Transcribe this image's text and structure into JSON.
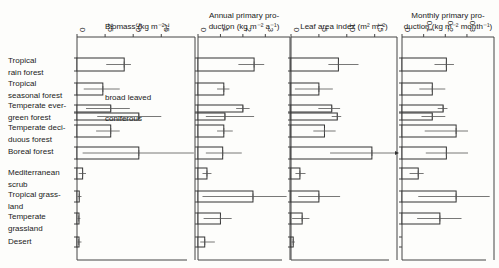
{
  "chart_data": {
    "type": "bar",
    "orientation": "horizontal",
    "categories": [
      "Tropical rain forest",
      "Tropical seasonal forest",
      "Temperate evergreen forest (broad leaved)",
      "Temperate evergreen forest (coniferous)",
      "Temperate deciduous forest",
      "Boreal forest",
      "Mediterranean scrub",
      "Tropical grassland",
      "Temperate grassland",
      "Desert"
    ],
    "row_labels": [
      [
        "Tropical",
        "rain forest"
      ],
      [
        "Tropical",
        "seasonal forest"
      ],
      [
        "Temperate ever-",
        "green forest"
      ],
      [
        "Temperate deci-",
        "duous forest"
      ],
      [
        "Boreal forest"
      ],
      [
        "Mediterranean",
        "scrub"
      ],
      [
        "Tropical grass-",
        "land"
      ],
      [
        "Temperate",
        "grassland"
      ],
      [
        "Desert"
      ]
    ],
    "annotations": [
      "broad leaved",
      "coniferous"
    ],
    "panels": [
      {
        "title": [
          "Biomass (kg m⁻²)"
        ],
        "ticks": [
          0,
          25,
          50,
          75
        ],
        "xlim": [
          0,
          105
        ],
        "values": [
          42,
          23,
          30,
          55,
          30,
          55,
          5,
          2,
          1.5,
          1.5
        ],
        "err_low": [
          26,
          6,
          8,
          18,
          17,
          5,
          1.5,
          0.5,
          0.5,
          0.5
        ],
        "err_high": [
          48,
          38,
          47,
          75,
          38,
          104,
          8,
          4,
          3,
          4
        ]
      },
      {
        "title": [
          "Annual primary pro-",
          "duction (kg m⁻² a⁻¹)"
        ],
        "ticks": [
          0,
          1,
          2,
          3
        ],
        "xlim": [
          0,
          4.1
        ],
        "values": [
          2.5,
          1.15,
          2.0,
          1.2,
          1.15,
          1.1,
          0.4,
          2.45,
          1.0,
          0.3
        ],
        "err_low": [
          1.8,
          0.85,
          1.7,
          0.35,
          0.85,
          0.35,
          0.2,
          0.2,
          0.25,
          0.1
        ],
        "err_high": [
          2.95,
          1.4,
          2.3,
          2.5,
          1.55,
          1.95,
          0.6,
          3.95,
          1.5,
          0.75
        ]
      },
      {
        "title": [
          "Leaf area index (m² m⁻²)"
        ],
        "ticks": [
          0,
          5,
          10,
          15
        ],
        "xlim": [
          0,
          19
        ],
        "values": [
          8.5,
          5.0,
          7.3,
          8.3,
          6.0,
          14.5,
          1.6,
          5.0,
          2.0,
          0.4
        ],
        "err_low": [
          6.7,
          0.7,
          4.9,
          7.3,
          4.0,
          7.0,
          0.8,
          1.3,
          0.2,
          0.1
        ],
        "err_high": [
          12.1,
          7.5,
          8.8,
          9.0,
          8.0,
          19.0,
          2.6,
          8.8,
          3.3,
          0.7
        ]
      },
      {
        "title": [
          "Monthly primary pro-",
          "duction (kg m⁻² month⁻¹)"
        ],
        "ticks": [
          0.0,
          0.1,
          0.2,
          0.3
        ],
        "tick_labels": [
          "0",
          "0.1",
          "0.2",
          "0.3"
        ],
        "xlim": [
          0,
          0.425
        ],
        "values": [
          0.205,
          0.14,
          0.19,
          0.14,
          0.25,
          0.205,
          0.075,
          0.25,
          0.175,
          null
        ],
        "err_low": [
          0.15,
          0.08,
          0.165,
          0.09,
          0.105,
          0.11,
          0.035,
          0.075,
          0.07,
          null
        ],
        "err_high": [
          0.24,
          0.2,
          0.21,
          0.2,
          0.305,
          0.305,
          0.1,
          0.405,
          0.275,
          null
        ]
      }
    ],
    "grid": false,
    "legend": null
  }
}
